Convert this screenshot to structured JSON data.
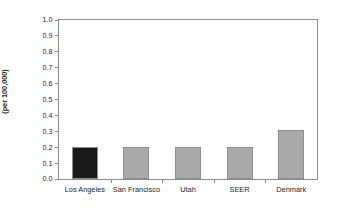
{
  "chart_data": {
    "type": "bar",
    "title": "",
    "subtitle": "",
    "xlabel": "",
    "ylabel": "Annual incidence (per 100,000)",
    "ylabel_line1": "Annual incidence",
    "ylabel_line2": "(per 100,000)",
    "categories": [
      "Los Angeles",
      "San Francisco",
      "Utah",
      "SEER",
      "Denmark"
    ],
    "values": [
      0.2,
      0.2,
      0.2,
      0.2,
      0.31
    ],
    "ylim": [
      0.0,
      1.0
    ],
    "ytick_step": 0.1,
    "ytick_labels": [
      "0.0",
      "0.1",
      "0.2",
      "0.3",
      "0.4",
      "0.5",
      "0.6",
      "0.7",
      "0.8",
      "0.9",
      "1.0"
    ],
    "ytick_values": [
      0.0,
      0.1,
      0.2,
      0.3,
      0.4,
      0.5,
      0.6,
      0.7,
      0.8,
      0.9,
      1.0
    ],
    "grid": false,
    "legend": "none",
    "bar_colors": [
      "#1a1a1a",
      "#a9a9a9",
      "#a9a9a9",
      "#a9a9a9",
      "#a9a9a9"
    ],
    "bar_edge_color": "#8d8d8d",
    "axis_color": "#8d8d8d",
    "text_color": "#231f20",
    "background": "#ffffff",
    "highlight_category": "Los Angeles"
  }
}
